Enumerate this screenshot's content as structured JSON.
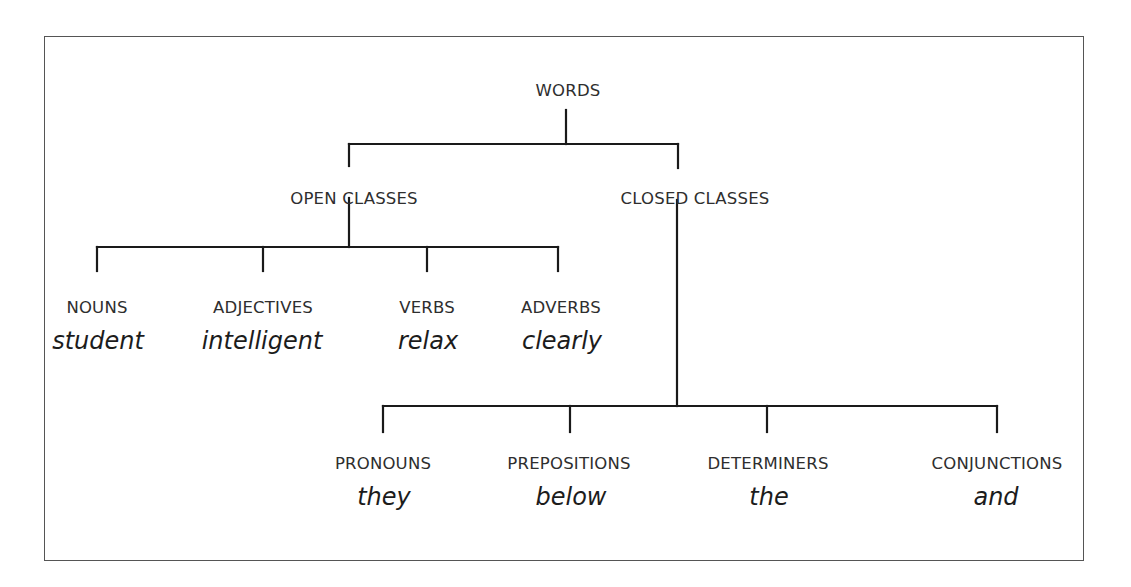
{
  "diagram": {
    "root": {
      "label": "WORDS"
    },
    "branches": [
      {
        "label": "OPEN CLASSES",
        "children": [
          {
            "category": "NOUNS",
            "example": "student"
          },
          {
            "category": "ADJECTIVES",
            "example": "intelligent"
          },
          {
            "category": "VERBS",
            "example": "relax"
          },
          {
            "category": "ADVERBS",
            "example": "clearly"
          }
        ]
      },
      {
        "label": "CLOSED CLASSES",
        "children": [
          {
            "category": "PRONOUNS",
            "example": "they"
          },
          {
            "category": "PREPOSITIONS",
            "example": "below"
          },
          {
            "category": "DETERMINERS",
            "example": "the"
          },
          {
            "category": "CONJUNCTIONS",
            "example": "and"
          }
        ]
      }
    ]
  }
}
